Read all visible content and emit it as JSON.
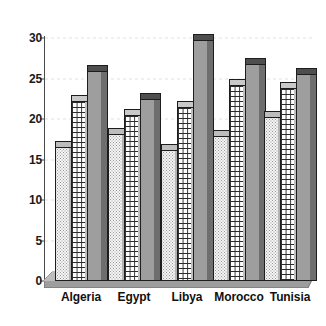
{
  "chart_data": {
    "type": "bar",
    "title": "",
    "subtitle": "",
    "xlabel": "",
    "ylabel": "",
    "categories": [
      "Algeria",
      "Egypt",
      "Libya",
      "Morocco",
      "Tunisia"
    ],
    "series": [
      {
        "name": "series-1",
        "pattern": "dotted",
        "values": [
          16.5,
          18.2,
          16.2,
          17.9,
          20.3
        ]
      },
      {
        "name": "series-2",
        "pattern": "grid",
        "values": [
          22.2,
          20.5,
          21.5,
          24.2,
          23.8
        ]
      },
      {
        "name": "series-3",
        "pattern": "solid-gray",
        "values": [
          25.9,
          22.5,
          29.7,
          26.8,
          25.5
        ]
      }
    ],
    "ylim": [
      0,
      30
    ],
    "yticks": [
      0,
      5,
      10,
      15,
      20,
      25,
      30
    ],
    "ytick_labels": [
      "0",
      "5",
      "10",
      "15",
      "20",
      "25",
      "30"
    ],
    "grid": true,
    "legend": "none",
    "style": "3d-bars",
    "annotations": []
  },
  "axis": {
    "y_tick_labels": [
      "30",
      "25",
      "20",
      "15",
      "10",
      "5",
      "0"
    ]
  },
  "colors": {
    "series1_fill": "#f4f4f4",
    "series2_fill": "#ffffff",
    "series3_fill": "#9e9e9e",
    "outline": "#1d1d1d",
    "floor": "#9d9d9d",
    "text": "#111111",
    "gridline": "#d8d8d8",
    "background": "#ffffff"
  }
}
